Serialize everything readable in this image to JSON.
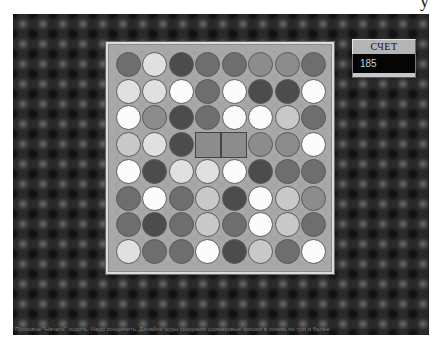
{
  "header": {
    "partial_glyph": "y"
  },
  "score": {
    "label": "СЧЕТ",
    "value": "185"
  },
  "status": {
    "text": "Пусковое \"Начать\" ходить. Надо соединить. Делайте ходы соединяя одинаковые фишки в линию по три и более"
  },
  "palette": {
    "white": "#fbfbfb",
    "vlight": "#e0e0e0",
    "light": "#c8c8c8",
    "mid": "#8c8c8c",
    "mdark": "#6e6e6e",
    "dark": "#4c4c4c",
    "board_bg": "#a8a8a8",
    "background_dark": "#2a2a2a"
  },
  "board": {
    "rows": 8,
    "cols": 8,
    "selected": [
      [
        3,
        3
      ],
      [
        3,
        4
      ]
    ],
    "cells": [
      [
        "mdark",
        "vlight",
        "dark",
        "mdark",
        "mdark",
        "mid",
        "mid",
        "mdark"
      ],
      [
        "vlight",
        "vlight",
        "white",
        "mdark",
        "white",
        "dark",
        "dark",
        "white"
      ],
      [
        "white",
        "mid",
        "dark",
        "mdark",
        "white",
        "white",
        "light",
        "mdark"
      ],
      [
        "light",
        "vlight",
        "dark",
        "mid",
        "mid",
        "mid",
        "mid",
        "white"
      ],
      [
        "white",
        "dark",
        "vlight",
        "vlight",
        "white",
        "dark",
        "mdark",
        "mdark"
      ],
      [
        "mdark",
        "white",
        "mdark",
        "light",
        "dark",
        "white",
        "light",
        "mid"
      ],
      [
        "mdark",
        "dark",
        "mdark",
        "light",
        "mdark",
        "white",
        "light",
        "mdark"
      ],
      [
        "vlight",
        "mdark",
        "mdark",
        "white",
        "dark",
        "light",
        "mdark",
        "white"
      ]
    ]
  }
}
